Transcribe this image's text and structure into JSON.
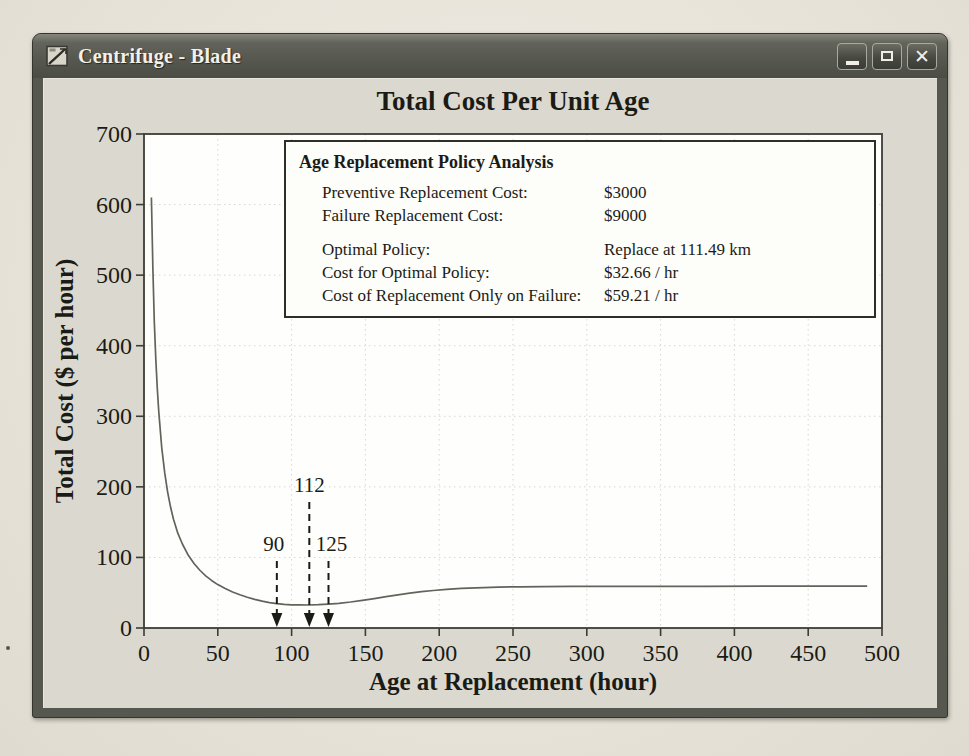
{
  "window": {
    "title": "Centrifuge - Blade",
    "controls": {
      "minimize": "minimize",
      "maximize": "maximize",
      "close": "close",
      "close_glyph": "✕"
    }
  },
  "info_panel": {
    "title": "Age Replacement Policy Analysis",
    "rows": [
      {
        "label": "Preventive Replacement Cost:",
        "value": "$3000",
        "group": 1
      },
      {
        "label": "Failure Replacement Cost:",
        "value": "$9000",
        "group": 1
      },
      {
        "label": "Optimal Policy:",
        "value": "Replace at 111.49 km",
        "group": 2
      },
      {
        "label": "Cost for Optimal Policy:",
        "value": "$32.66 / hr",
        "group": 2
      },
      {
        "label": "Cost of Replacement Only on Failure:",
        "value": "$59.21 / hr",
        "group": 2
      }
    ]
  },
  "chart_data": {
    "type": "line",
    "title": "Total Cost Per Unit Age",
    "xlabel": "Age at Replacement (hour)",
    "ylabel": "Total Cost ($ per hour)",
    "xlim": [
      0,
      500
    ],
    "ylim": [
      0,
      700
    ],
    "xticks": [
      0,
      50,
      100,
      150,
      200,
      250,
      300,
      350,
      400,
      450,
      500
    ],
    "yticks": [
      0,
      100,
      200,
      300,
      400,
      500,
      600,
      700
    ],
    "grid": true,
    "legend": "none",
    "series_name": "Total cost per unit age",
    "curve": [
      [
        5,
        610
      ],
      [
        6,
        508
      ],
      [
        7,
        434
      ],
      [
        8,
        381
      ],
      [
        9,
        339
      ],
      [
        10,
        306
      ],
      [
        12,
        256
      ],
      [
        14,
        220
      ],
      [
        16,
        193
      ],
      [
        18,
        171
      ],
      [
        20,
        154
      ],
      [
        23,
        134
      ],
      [
        26,
        119
      ],
      [
        30,
        103
      ],
      [
        34,
        91
      ],
      [
        38,
        81.5
      ],
      [
        42,
        73.5
      ],
      [
        46,
        67
      ],
      [
        50,
        61.5
      ],
      [
        55,
        55.8
      ],
      [
        60,
        51
      ],
      [
        65,
        47
      ],
      [
        70,
        43.5
      ],
      [
        75,
        40.5
      ],
      [
        80,
        38
      ],
      [
        85,
        36
      ],
      [
        90,
        34.4
      ],
      [
        95,
        33.4
      ],
      [
        100,
        32.9
      ],
      [
        105,
        32.7
      ],
      [
        111.49,
        32.66
      ],
      [
        118,
        33
      ],
      [
        125,
        33.8
      ],
      [
        132,
        35
      ],
      [
        140,
        36.9
      ],
      [
        148,
        39.2
      ],
      [
        156,
        41.7
      ],
      [
        164,
        44.3
      ],
      [
        172,
        46.9
      ],
      [
        180,
        49.3
      ],
      [
        188,
        51.4
      ],
      [
        196,
        53.2
      ],
      [
        205,
        54.8
      ],
      [
        215,
        56.1
      ],
      [
        225,
        57
      ],
      [
        240,
        57.9
      ],
      [
        255,
        58.4
      ],
      [
        270,
        58.7
      ],
      [
        290,
        58.9
      ],
      [
        310,
        59
      ],
      [
        340,
        59.1
      ],
      [
        380,
        59.15
      ],
      [
        420,
        59.2
      ],
      [
        460,
        59.2
      ],
      [
        490,
        59.2
      ]
    ],
    "optimal_point": {
      "x": 111.49,
      "y": 32.66
    },
    "asymptote_cost": 59.21,
    "annotations": [
      {
        "label": "90",
        "x": 90,
        "tier": "low",
        "dx": -3
      },
      {
        "label": "112",
        "x": 112,
        "tier": "high",
        "dx": 0
      },
      {
        "label": "125",
        "x": 125,
        "tier": "low",
        "dx": 3
      }
    ]
  },
  "colors": {
    "titlebar": "#565750",
    "client_bg": "#dbd9cf",
    "paper_bg": "#e8e4da",
    "plot_bg": "#fefefc",
    "plot_frame": "#3c3c35",
    "grid": "#d8d8cf",
    "curve": "#63635c",
    "annotation": "#1b1b16",
    "text": "#1b1b16"
  }
}
